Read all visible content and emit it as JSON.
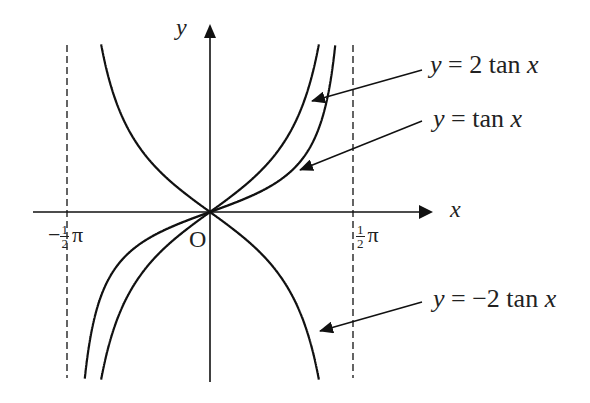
{
  "chart_data": {
    "type": "line",
    "title": "",
    "xlabel": "x",
    "ylabel": "y",
    "origin_label": "O",
    "x_ticks": [
      {
        "label_sign": "−",
        "label_num": "1",
        "label_den": "2",
        "label_pi": "π",
        "value": "-π/2"
      },
      {
        "label_sign": "",
        "label_num": "1",
        "label_den": "2",
        "label_pi": "π",
        "value": "π/2"
      }
    ],
    "asymptotes": [
      "x = -π/2",
      "x = π/2"
    ],
    "xlim": [
      "-π/2",
      "π/2"
    ],
    "grid": false,
    "series": [
      {
        "name": "y = 2 tan x",
        "label_y": "y",
        "label_eq": " = 2 tan ",
        "label_x": "x",
        "function": "2*tan(x)"
      },
      {
        "name": "y = tan x",
        "label_y": "y",
        "label_eq": " = tan ",
        "label_x": "x",
        "function": "tan(x)"
      },
      {
        "name": "y = −2 tan x",
        "label_y": "y",
        "label_eq": " = −2 tan ",
        "label_x": "x",
        "function": "-2*tan(x)"
      }
    ]
  }
}
